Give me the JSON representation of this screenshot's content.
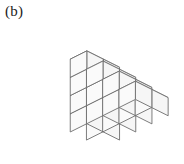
{
  "figure": {
    "label": "(b)",
    "caption_position": "top-left",
    "type": "isometric-cube-stack",
    "colors": {
      "outline": "#6d6d6d",
      "top_face": "#fdfdfd",
      "left_face": "#fafafa",
      "right_face": "#f6f6f6",
      "background": "#ffffff",
      "label_text": "#1b1b1b"
    },
    "geometry": {
      "origin_x": 103,
      "origin_y": 148,
      "half_width": 16.2,
      "half_depth": 16.2,
      "cube_height": 18.2,
      "columns_x": 4,
      "columns_y": 2,
      "note": "heights[x][y] gives number of stacked cubes at grid cell"
    },
    "heights": [
      [
        4,
        4
      ],
      [
        3,
        3
      ],
      [
        2,
        2
      ],
      [
        1,
        1
      ]
    ],
    "cube_count": 20,
    "step_levels": [
      4,
      3,
      2,
      1
    ]
  }
}
